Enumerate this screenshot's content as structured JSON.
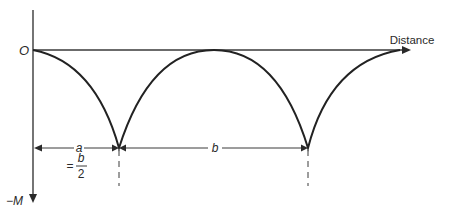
{
  "diagram": {
    "type": "bending-moment-diagram",
    "axes": {
      "origin_label": "O",
      "x_label": "Distance",
      "y_label": "−M"
    },
    "dimensions": {
      "a_label": "a",
      "a_equals": "=",
      "a_fraction_numerator": "b",
      "a_fraction_denominator": "2",
      "b_label": "b"
    },
    "colors": {
      "line": "#2a2a2a",
      "curve": "#222222",
      "background": "#ffffff"
    }
  }
}
